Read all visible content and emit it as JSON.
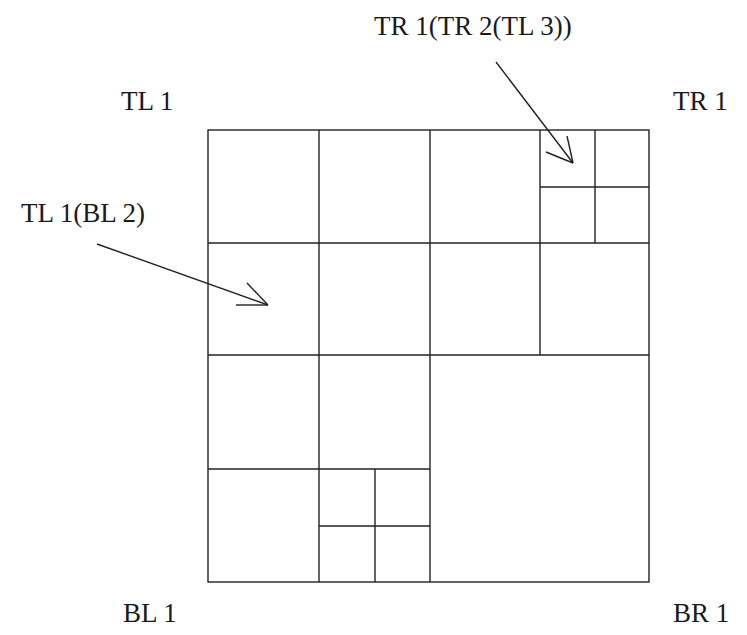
{
  "diagram": {
    "type": "quadtree",
    "corner_labels": {
      "top_left": "TL 1",
      "top_right": "TR 1",
      "bottom_left": "BL 1",
      "bottom_right": "BR 1"
    },
    "annotations": [
      {
        "id": "tl1-bl2",
        "text": "TL 1(BL 2)"
      },
      {
        "id": "tr1-tr2-tl3",
        "text": "TR 1(TR 2(TL 3))"
      }
    ],
    "colors": {
      "line": "#222222",
      "background": "#ffffff"
    }
  }
}
